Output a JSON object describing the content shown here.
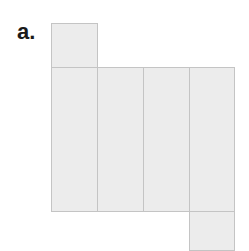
{
  "figure": {
    "label": "a.",
    "colors": {
      "fill": "#ececec",
      "stroke": "#c4c4c4",
      "label": "#1a1a1a"
    },
    "faces": [
      {
        "id": "top-square",
        "x": 51,
        "y": 23,
        "w": 46,
        "h": 44
      },
      {
        "id": "rect-1",
        "x": 51,
        "y": 67,
        "w": 46,
        "h": 144
      },
      {
        "id": "rect-2",
        "x": 97,
        "y": 67,
        "w": 46,
        "h": 144
      },
      {
        "id": "rect-3",
        "x": 143,
        "y": 67,
        "w": 46,
        "h": 144
      },
      {
        "id": "rect-4",
        "x": 189,
        "y": 67,
        "w": 45,
        "h": 144
      },
      {
        "id": "bottom-square",
        "x": 189,
        "y": 211,
        "w": 45,
        "h": 40
      }
    ]
  }
}
